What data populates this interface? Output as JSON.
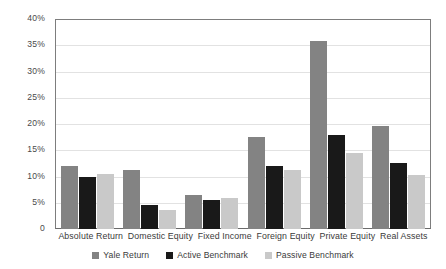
{
  "chart_data": {
    "type": "bar",
    "title": "",
    "xlabel": "",
    "ylabel": "",
    "ylim": [
      0,
      40
    ],
    "ytick_labels": [
      "40%",
      "35%",
      "30%",
      "25%",
      "20%",
      "15%",
      "10%",
      "5%",
      "0"
    ],
    "ytick_values": [
      40,
      35,
      30,
      25,
      20,
      15,
      10,
      5,
      0
    ],
    "grid": true,
    "legend_position": "bottom",
    "categories": [
      "Absolute Return",
      "Domestic Equity",
      "Fixed Income",
      "Foreign Equity",
      "Private Equity",
      "Real Assets"
    ],
    "series": [
      {
        "name": "Yale Return",
        "color": "#838383",
        "values": [
          12.0,
          11.2,
          6.4,
          17.5,
          35.8,
          19.7
        ]
      },
      {
        "name": "Active Benchmark",
        "color": "#191919",
        "values": [
          10.0,
          4.5,
          5.6,
          12.0,
          18.0,
          12.5
        ]
      },
      {
        "name": "Passive Benchmark",
        "color": "#c9c9c9",
        "values": [
          10.5,
          3.7,
          6.0,
          11.3,
          14.5,
          10.2
        ]
      }
    ]
  }
}
